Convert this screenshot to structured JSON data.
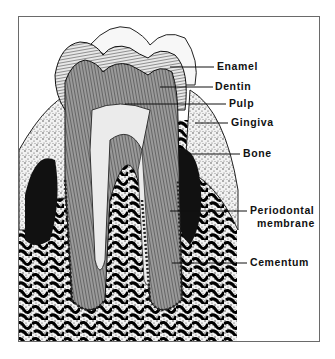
{
  "diagram": {
    "labels": [
      {
        "id": "enamel",
        "text": "Enamel"
      },
      {
        "id": "dentin",
        "text": "Dentin"
      },
      {
        "id": "pulp",
        "text": "Pulp"
      },
      {
        "id": "gingiva",
        "text": "Gingiva"
      },
      {
        "id": "bone",
        "text": "Bone"
      },
      {
        "id": "periodontal-membrane",
        "text": "Periodontal",
        "text2": "membrane"
      },
      {
        "id": "cementum",
        "text": "Cementum"
      }
    ]
  }
}
